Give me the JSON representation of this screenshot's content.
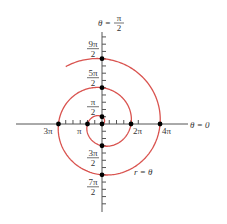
{
  "figure": {
    "type": "polar-spiral",
    "equation_label": "r = θ",
    "curve_color": "#d9534f",
    "axis_color": "#555555",
    "point_color": "#000000",
    "theta_max": 14.7,
    "axis_labels": {
      "polar_axis": "θ = 0",
      "vertical_axis": {
        "prefix": "θ = ",
        "num": "π",
        "den": "2"
      }
    },
    "horizontal_labels": [
      {
        "text": "3π",
        "r": -9.4248
      },
      {
        "text": "π",
        "r": -3.1416
      },
      {
        "text": "2π",
        "r": 6.2832
      },
      {
        "text": "4π",
        "r": 12.5664
      }
    ],
    "vertical_labels": [
      {
        "num": "9π",
        "den": "2",
        "r": 14.1372
      },
      {
        "num": "5π",
        "den": "2",
        "r": 7.854
      },
      {
        "num": "π",
        "den": "2",
        "r": 1.5708
      },
      {
        "num": "3π",
        "den": "2",
        "r": -4.7124
      },
      {
        "num": "7π",
        "den": "2",
        "r": -10.9956
      }
    ],
    "points": [
      {
        "theta": "0",
        "x": 0,
        "y": 0
      },
      {
        "theta": "π/2",
        "x": 0,
        "y": 1.5708
      },
      {
        "theta": "π",
        "x": -3.1416,
        "y": 0
      },
      {
        "theta": "3π/2",
        "x": 0,
        "y": -4.7124
      },
      {
        "theta": "2π",
        "x": 6.2832,
        "y": 0
      },
      {
        "theta": "5π/2",
        "x": 0,
        "y": 7.854
      },
      {
        "theta": "3π",
        "x": -9.4248,
        "y": 0
      },
      {
        "theta": "7π/2",
        "x": 0,
        "y": -10.9956
      },
      {
        "theta": "4π",
        "x": 12.5664,
        "y": 0
      },
      {
        "theta": "9π/2",
        "x": 0,
        "y": 14.1372
      }
    ]
  }
}
